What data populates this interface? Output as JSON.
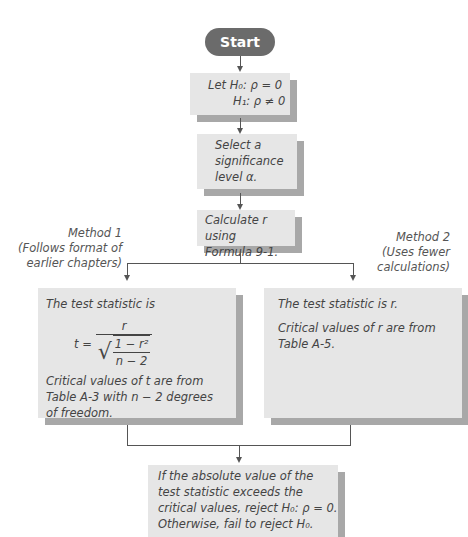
{
  "flowchart": {
    "start": "Start",
    "step1": {
      "line1": "Let H₀: ρ = 0",
      "line2": "H₁: ρ ≠ 0"
    },
    "step2": {
      "line1": "Select a",
      "line2": "significance",
      "line3": "level α."
    },
    "step3": {
      "line1": "Calculate r using",
      "line2": "Formula 9-1."
    },
    "method1": {
      "title": "Method 1",
      "line2": "(Follows format of",
      "line3": "earlier chapters)"
    },
    "method2": {
      "title": "Method 2",
      "line2": "(Uses fewer",
      "line3": "calculations)"
    },
    "box_left": {
      "intro": "The test statistic is",
      "formula": {
        "lhs": "t =",
        "numerator": "r",
        "inner_num": "1 − r²",
        "inner_den": "n − 2"
      },
      "critical": "Critical values of t are from Table A-3 with n − 2 degrees of freedom."
    },
    "box_right": {
      "intro": "The test statistic is r.",
      "critical": "Critical values of r are from Table A-5."
    },
    "final": {
      "line1": "If the absolute value of the",
      "line2": "test statistic exceeds the",
      "line3": "critical values, reject H₀: ρ = 0.",
      "line4": "Otherwise, fail to reject H₀."
    }
  }
}
